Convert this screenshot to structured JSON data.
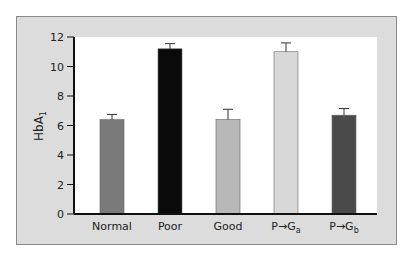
{
  "chart_data": {
    "type": "bar",
    "title": "",
    "xlabel": "",
    "ylabel": "HbA1",
    "ylabel_main": "HbA",
    "ylabel_sub": "1",
    "ylim": [
      0,
      12
    ],
    "yticks": [
      0,
      2,
      4,
      6,
      8,
      10,
      12
    ],
    "grid": false,
    "legend": null,
    "categories": [
      "Normal",
      "Poor",
      "Good",
      "P→Ga",
      "P→Gb"
    ],
    "category_labels": [
      {
        "main": "Normal",
        "sub": ""
      },
      {
        "main": "Poor",
        "sub": ""
      },
      {
        "main": "Good",
        "sub": ""
      },
      {
        "main": "P→G",
        "sub": "a"
      },
      {
        "main": "P→G",
        "sub": "b"
      }
    ],
    "values": [
      6.4,
      11.2,
      6.4,
      11.0,
      6.7
    ],
    "error_plus": [
      0.35,
      0.35,
      0.7,
      0.6,
      0.45
    ],
    "bar_colors": [
      "#7a7a7a",
      "#0a0a0a",
      "#b8b8b8",
      "#d8d8d8",
      "#4a4a4a"
    ]
  }
}
